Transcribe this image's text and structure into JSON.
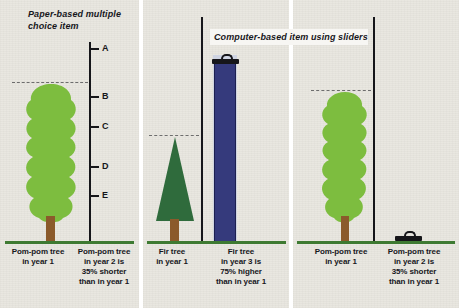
{
  "figure": {
    "panels": [
      {
        "id": "paper-based",
        "title": "Paper-based multiple choice item",
        "scale": {
          "ticks": [
            {
              "label": "A",
              "y": 48
            },
            {
              "label": "B",
              "y": 96
            },
            {
              "label": "C",
              "y": 126
            },
            {
              "label": "D",
              "y": 166
            },
            {
              "label": "E",
              "y": 195
            }
          ]
        },
        "items": [
          {
            "kind": "pom-pom-tree",
            "caption": "Pom-pom tree in year 1",
            "caption_lines": [
              "Pom-pom tree",
              "in year 1"
            ]
          },
          {
            "kind": "answer-scale",
            "caption": "Pom-pom tree in year 2 is 35% shorter than in year 1",
            "caption_lines": [
              "Pom-pom tree",
              "in year 2 is",
              "35% shorter",
              "than in year 1"
            ]
          }
        ]
      },
      {
        "id": "computer-based",
        "title": "Computer-based item using sliders",
        "items": [
          {
            "kind": "fir-tree",
            "caption": "Fir tree in year 1",
            "caption_lines": [
              "Fir tree",
              "in year 1"
            ]
          },
          {
            "kind": "slider-raised",
            "caption": "Fir tree in year 3 is 75% higher than in year 1",
            "caption_lines": [
              "Fir tree",
              "in year 3 is",
              "75% higher",
              "than in year 1"
            ]
          }
        ]
      },
      {
        "id": "computer-based-second",
        "items": [
          {
            "kind": "pom-pom-tree",
            "caption": "Pom-pom tree in year 1",
            "caption_lines": [
              "Pom-pom tree",
              "in year 1"
            ]
          },
          {
            "kind": "slider-collapsed",
            "caption": "Pom-pom tree in year 2 is 35% shorter than in year 1",
            "caption_lines": [
              "Pom-pom tree",
              "in year 2 is",
              "35% shorter",
              "than in year 1"
            ]
          }
        ]
      }
    ],
    "colors": {
      "panel_background": "#e9e7e0",
      "ground_green": "#3e7a32",
      "pompom_green": "#7dbd3f",
      "fir_green": "#2f6b3c",
      "trunk_brown": "#8b5a2b",
      "slider_blue": "#353a7c",
      "slider_track": "#cfd4e2",
      "rule_black": "#16161a",
      "dash_gray": "#6d6d6d"
    }
  }
}
